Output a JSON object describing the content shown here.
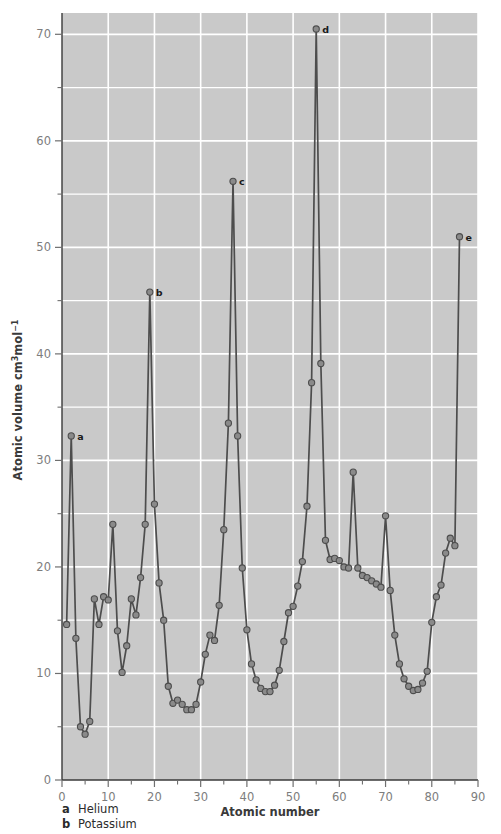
{
  "chart_data": {
    "type": "line",
    "title": "",
    "xlabel": "Atomic number",
    "ylabel": "Atomic volume cm³mol⁻¹",
    "ylabel_parts": {
      "main": "Atomic volume cm",
      "sup1": "3",
      "mid": "mol",
      "sup2": "−1"
    },
    "xlim": [
      0,
      90
    ],
    "ylim": [
      0,
      72
    ],
    "x_ticks": [
      0,
      10,
      20,
      30,
      40,
      50,
      60,
      70,
      80,
      90
    ],
    "x_tick_labels": [
      "0",
      "10",
      "20",
      "30",
      "40",
      "50",
      "60",
      "70",
      "80",
      "90"
    ],
    "x_minor_ticks": [
      5,
      15,
      25,
      35,
      45,
      55,
      65,
      75,
      85
    ],
    "y_ticks": [
      0,
      10,
      20,
      30,
      40,
      50,
      60,
      70
    ],
    "y_tick_labels": [
      "0",
      "10",
      "20",
      "30",
      "40",
      "50",
      "60",
      "70"
    ],
    "y_minor_ticks": [
      5,
      15,
      25,
      35,
      45,
      55,
      65
    ],
    "grid": true,
    "grid_color": "#ffffff",
    "plot_bg": "#c9c9c9",
    "line_color": "#4d4d4d",
    "marker_color": "#8a8a8a",
    "marker_edge_color": "#4d4d4d",
    "legend_position": "below-axes",
    "series": [
      {
        "name": "Atomic volume",
        "x": [
          1,
          2,
          3,
          4,
          5,
          6,
          7,
          8,
          9,
          10,
          11,
          12,
          13,
          14,
          15,
          16,
          17,
          18,
          19,
          20,
          21,
          22,
          23,
          24,
          25,
          26,
          27,
          28,
          29,
          30,
          31,
          32,
          33,
          34,
          35,
          36,
          37,
          38,
          39,
          40,
          41,
          42,
          43,
          44,
          45,
          46,
          47,
          48,
          49,
          50,
          51,
          52,
          53,
          54,
          55,
          56,
          57,
          58,
          59,
          60,
          61,
          62,
          63,
          64,
          65,
          66,
          67,
          68,
          69,
          70,
          71,
          72,
          73,
          74,
          75,
          76,
          77,
          78,
          79,
          80,
          81,
          82,
          83,
          84,
          85,
          86
        ],
        "y": [
          14.6,
          32.3,
          13.3,
          5.0,
          4.3,
          5.5,
          17.0,
          14.6,
          17.2,
          16.9,
          24.0,
          14.0,
          10.1,
          12.6,
          17.0,
          15.5,
          19.0,
          24.0,
          45.8,
          25.9,
          18.5,
          15.0,
          8.8,
          7.2,
          7.5,
          7.1,
          6.6,
          6.6,
          7.1,
          9.2,
          11.8,
          13.6,
          13.1,
          16.4,
          23.5,
          33.5,
          56.2,
          32.3,
          19.9,
          14.1,
          10.9,
          9.4,
          8.6,
          8.3,
          8.3,
          8.9,
          10.3,
          13.0,
          15.7,
          16.3,
          18.2,
          20.5,
          25.7,
          37.3,
          70.5,
          39.1,
          22.5,
          20.7,
          20.8,
          20.6,
          20.0,
          19.9,
          28.9,
          19.9,
          19.2,
          19.0,
          18.7,
          18.4,
          18.1,
          24.8,
          17.8,
          13.6,
          10.9,
          9.5,
          8.8,
          8.4,
          8.5,
          9.1,
          10.2,
          14.8,
          17.2,
          18.3,
          21.3,
          22.7,
          22.0,
          51.0
        ]
      }
    ],
    "annotations": [
      {
        "key": "a",
        "x": 2,
        "y": 32.3,
        "element": "Helium"
      },
      {
        "key": "b",
        "x": 19,
        "y": 45.8,
        "element": "Potassium"
      },
      {
        "key": "c",
        "x": 37,
        "y": 56.2,
        "element": "Rubidium"
      },
      {
        "key": "d",
        "x": 55,
        "y": 70.5,
        "element": "Caesium"
      },
      {
        "key": "e",
        "x": 86,
        "y": 51.0,
        "element": "Radon"
      }
    ]
  },
  "legend": {
    "items": [
      {
        "key": "a",
        "name": "Helium"
      },
      {
        "key": "b",
        "name": "Potassium"
      }
    ]
  }
}
